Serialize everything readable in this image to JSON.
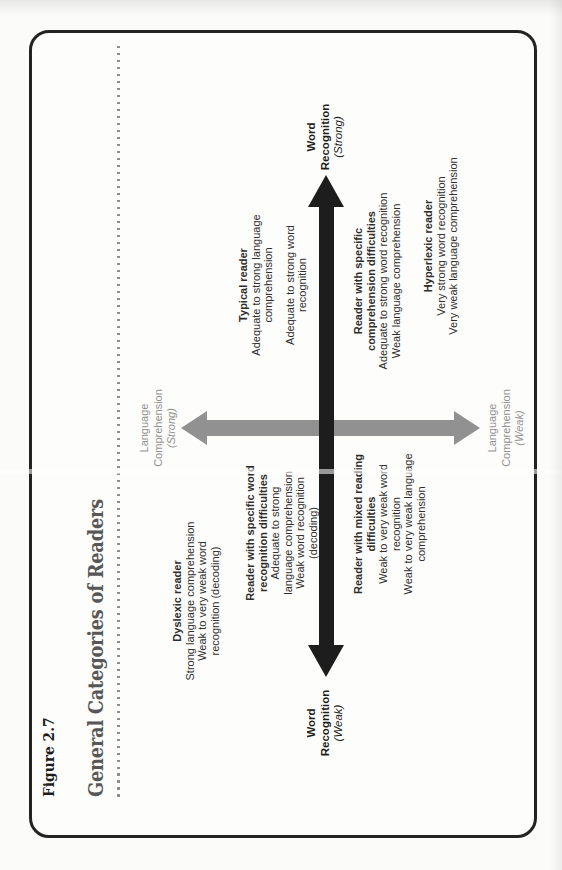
{
  "figure": {
    "label": "Figure 2.7",
    "title": "General Categories of Readers"
  },
  "axes": {
    "word_recognition_strong": {
      "line1": "Word",
      "line2": "Recognition",
      "qualifier": "(Strong)"
    },
    "word_recognition_weak": {
      "line1": "Word",
      "line2": "Recognition",
      "qualifier": "(Weak)"
    },
    "language_comprehension_strong": {
      "line1": "Language",
      "line2": "Comprehension",
      "qualifier": "(Strong)"
    },
    "language_comprehension_weak": {
      "line1": "Language",
      "line2": "Comprehension",
      "qualifier": "(Weak)"
    }
  },
  "readers": {
    "dyslexic": {
      "name": "Dyslexic reader",
      "details": [
        "Strong language comprehension",
        "Weak to very weak word",
        "recognition (decoding)"
      ]
    },
    "specific_word_recognition": {
      "name_lines": [
        "Reader with specific word",
        "recognition difficulties"
      ],
      "details": [
        "Adequate to strong",
        "language comprehension",
        "Weak word recognition",
        "(decoding)"
      ]
    },
    "typical": {
      "name": "Typical reader",
      "details_group1": [
        "Adequate to strong language",
        "comprehension"
      ],
      "details_group2": [
        "Adequate to strong word",
        "recognition"
      ]
    },
    "specific_comprehension": {
      "name_lines": [
        "Reader with specific",
        "comprehension difficulties"
      ],
      "details": [
        "Adequate to strong word recognition",
        "Weak language comprehension"
      ]
    },
    "hyperlexic": {
      "name": "Hyperlexic reader",
      "details": [
        "Very strong word recognition",
        "Very weak language comprehension"
      ]
    },
    "mixed": {
      "name_lines": [
        "Reader with mixed reading",
        "difficulties"
      ],
      "details": [
        "Weak to very weak word",
        "recognition",
        "Weak to very weak language",
        "comprehension"
      ]
    }
  },
  "colors": {
    "word_recognition_arrow": "#1d1d1d",
    "language_comprehension_arrow": "#919191",
    "title": "#575757",
    "body_text": "#2e2e2e",
    "frame_border": "#232323",
    "dotted_rule": "#8e8e8e",
    "paper": "#fbfbf9"
  }
}
